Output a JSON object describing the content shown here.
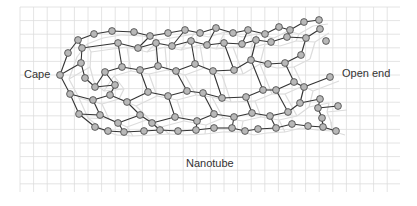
{
  "diagram": {
    "labels": {
      "cape": "Cape",
      "open_end": "Open end",
      "nanotube": "Nanotube"
    },
    "colors": {
      "background": "#ffffff",
      "grid": "#dddddd",
      "bond": "#333333",
      "back_bond": "#dcdcdc",
      "atom_fill": "#b8b8b8",
      "atom_stroke": "#444444"
    },
    "grid": {
      "x0": 20,
      "y0": 7,
      "x1": 400,
      "y1": 192,
      "cell": 13.6
    }
  }
}
